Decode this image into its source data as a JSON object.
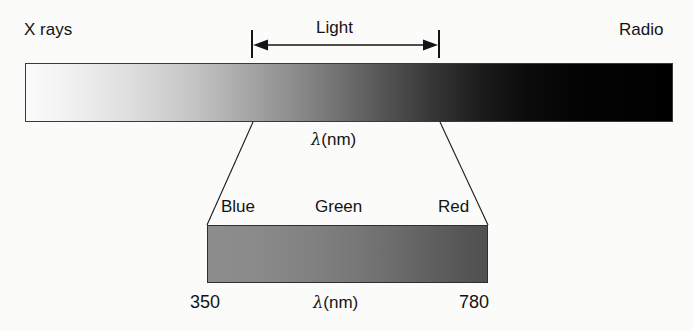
{
  "figure": {
    "background_color": "#fbfbfa",
    "ink_color": "#131313"
  },
  "spectrum": {
    "left_label": "X rays",
    "right_label": "Radio",
    "band_label": "Light",
    "axis_label": "λ(nm)",
    "gradient_from": "#fbfbfb",
    "gradient_to": "#000000",
    "bar_bounds": {
      "x": 25,
      "y": 63,
      "width": 648,
      "height": 59
    },
    "bracket": {
      "x_start": 252,
      "x_end": 439,
      "y": 45
    }
  },
  "visible": {
    "labels": [
      "Blue",
      "Green",
      "Red"
    ],
    "axis_label": "λ(nm)",
    "wavelength_min": "350",
    "wavelength_max": "780",
    "gradient_from": "#8d8d8d",
    "gradient_to": "#505050",
    "bar_bounds": {
      "x": 207,
      "y": 225,
      "width": 281,
      "height": 58
    }
  },
  "chart_data": {
    "type": "bar",
    "xlabel": "λ(nm)",
    "ylabel": "",
    "grid": false,
    "legend": "none",
    "series": [
      {
        "name": "Electromagnetic spectrum",
        "categories": [
          "X rays",
          "Light",
          "Radio"
        ],
        "annotations": [
          "X rays",
          "Light",
          "Radio",
          "λ(nm)"
        ],
        "gradient": [
          "#fbfbfb",
          "#000000"
        ],
        "bracket_band": "Light"
      },
      {
        "name": "Visible spectrum detail",
        "categories": [
          "Blue",
          "Green",
          "Red"
        ],
        "x": [
          350,
          780
        ],
        "tick_labels": [
          "350",
          "780"
        ],
        "annotations": [
          "Blue",
          "Green",
          "Red",
          "λ(nm)",
          "350",
          "780"
        ],
        "gradient": [
          "#8d8d8d",
          "#505050"
        ]
      }
    ]
  }
}
